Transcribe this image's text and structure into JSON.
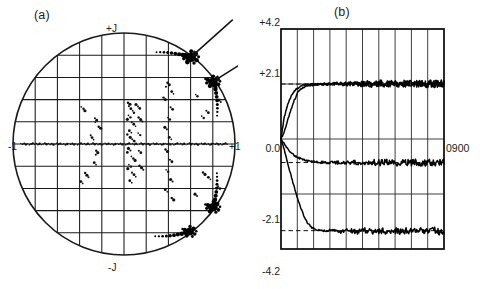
{
  "figure": {
    "background_color": "#ffffff",
    "ink_color": "#1a1a1a",
    "width": 491,
    "height": 289
  },
  "panel_a": {
    "caption": "(a)",
    "axis_labels": {
      "top": "+J",
      "bottom": "-J",
      "left": "-1",
      "right": "+1"
    },
    "annotations": [
      {
        "name": "arrow-upper-cluster",
        "label": ""
      },
      {
        "name": "arrow-right-cluster",
        "label": ""
      }
    ]
  },
  "panel_b": {
    "caption": "(b)",
    "tick_labels": {
      "top": "+4.2",
      "upper": "+2.1",
      "middle": "0.0",
      "lower": "-2.1",
      "bottom": "-4.2"
    },
    "trace_label": "0900"
  },
  "chart_data": [
    {
      "type": "scatter",
      "name": "panel-a-constellation",
      "title": "(a)",
      "xlabel": "",
      "ylabel": "",
      "xlim": [
        -1.0,
        1.0
      ],
      "ylim": [
        -1.0,
        1.0
      ],
      "grid": true,
      "grid_divisions": 10,
      "unit_circle": true,
      "axis_annotations": {
        "top": "+J",
        "bottom": "-J",
        "left": "-1",
        "right": "+1"
      },
      "arrows": [
        {
          "points_to_x": 0.6,
          "points_to_y": 0.78,
          "from_x": 0.98,
          "from_y": 1.12
        },
        {
          "points_to_x": 0.8,
          "points_to_y": 0.56,
          "from_x": 1.18,
          "from_y": 0.8
        }
      ],
      "clusters": [
        {
          "x": 0.6,
          "y": 0.78,
          "weight": 1.0,
          "label": "dense-cluster-upper-right"
        },
        {
          "x": 0.8,
          "y": 0.56,
          "weight": 0.9,
          "label": "dense-cluster-right-upper"
        },
        {
          "x": 0.8,
          "y": -0.57,
          "weight": 0.9,
          "label": "dense-cluster-right-lower"
        },
        {
          "x": 0.59,
          "y": -0.79,
          "weight": 0.85,
          "label": "dense-cluster-lower-right"
        }
      ],
      "points": [
        [
          -0.385,
          0.335
        ],
        [
          -0.365,
          0.318
        ],
        [
          -0.352,
          0.3
        ],
        [
          -0.262,
          0.232
        ],
        [
          -0.246,
          0.215
        ],
        [
          -0.258,
          0.196
        ],
        [
          -0.228,
          0.155
        ],
        [
          -0.21,
          0.142
        ],
        [
          -0.3,
          0.078
        ],
        [
          -0.288,
          0.058
        ],
        [
          -0.274,
          0.04
        ],
        [
          -0.25,
          -0.06
        ],
        [
          -0.236,
          -0.078
        ],
        [
          -0.254,
          -0.096
        ],
        [
          -0.268,
          -0.168
        ],
        [
          -0.252,
          -0.186
        ],
        [
          -0.35,
          -0.262
        ],
        [
          -0.334,
          -0.282
        ],
        [
          -0.32,
          -0.3
        ],
        [
          -0.388,
          -0.338
        ],
        [
          -0.372,
          -0.355
        ],
        [
          0.036,
          0.372
        ],
        [
          0.054,
          0.358
        ],
        [
          0.044,
          0.34
        ],
        [
          0.062,
          0.318
        ],
        [
          0.078,
          0.3
        ],
        [
          0.09,
          0.282
        ],
        [
          0.108,
          0.356
        ],
        [
          0.126,
          0.338
        ],
        [
          0.142,
          0.32
        ],
        [
          0.04,
          0.258
        ],
        [
          0.058,
          0.24
        ],
        [
          0.03,
          0.222
        ],
        [
          0.07,
          0.196
        ],
        [
          0.088,
          0.178
        ],
        [
          0.104,
          0.16
        ],
        [
          0.132,
          0.238
        ],
        [
          0.15,
          0.22
        ],
        [
          0.166,
          0.202
        ],
        [
          0.048,
          0.12
        ],
        [
          0.066,
          0.102
        ],
        [
          0.03,
          0.086
        ],
        [
          0.056,
          0.06
        ],
        [
          0.074,
          0.042
        ],
        [
          0.092,
          0.026
        ],
        [
          0.128,
          0.098
        ],
        [
          0.146,
          0.08
        ],
        [
          0.04,
          -0.04
        ],
        [
          0.058,
          -0.058
        ],
        [
          0.03,
          -0.076
        ],
        [
          0.066,
          -0.112
        ],
        [
          0.084,
          -0.13
        ],
        [
          0.1,
          -0.148
        ],
        [
          0.134,
          -0.06
        ],
        [
          0.152,
          -0.078
        ],
        [
          0.044,
          -0.186
        ],
        [
          0.062,
          -0.204
        ],
        [
          0.034,
          -0.222
        ],
        [
          0.072,
          -0.258
        ],
        [
          0.09,
          -0.276
        ],
        [
          0.106,
          -0.294
        ],
        [
          0.14,
          -0.196
        ],
        [
          0.158,
          -0.214
        ],
        [
          0.174,
          -0.232
        ],
        [
          0.052,
          -0.33
        ],
        [
          0.07,
          -0.348
        ],
        [
          0.392,
          0.552
        ],
        [
          0.408,
          0.534
        ],
        [
          0.378,
          0.516
        ],
        [
          0.43,
          0.472
        ],
        [
          0.446,
          0.452
        ],
        [
          0.356,
          0.418
        ],
        [
          0.372,
          0.4
        ],
        [
          0.42,
          0.33
        ],
        [
          0.438,
          0.312
        ],
        [
          0.396,
          0.238
        ],
        [
          0.414,
          0.22
        ],
        [
          0.368,
          0.15
        ],
        [
          0.386,
          0.132
        ],
        [
          0.408,
          0.06
        ],
        [
          0.426,
          0.042
        ],
        [
          0.374,
          -0.05
        ],
        [
          0.392,
          -0.068
        ],
        [
          0.414,
          -0.142
        ],
        [
          0.432,
          -0.16
        ],
        [
          0.38,
          -0.232
        ],
        [
          0.398,
          -0.25
        ],
        [
          0.42,
          -0.32
        ],
        [
          0.438,
          -0.338
        ],
        [
          0.372,
          -0.412
        ],
        [
          0.39,
          -0.43
        ],
        [
          0.43,
          -0.486
        ],
        [
          0.448,
          -0.504
        ],
        [
          0.742,
          0.3
        ],
        [
          0.76,
          0.282
        ],
        [
          0.7,
          0.252
        ],
        [
          0.718,
          0.234
        ],
        [
          0.856,
          0.396
        ],
        [
          0.872,
          0.378
        ],
        [
          0.76,
          -0.3
        ],
        [
          0.778,
          -0.318
        ],
        [
          0.712,
          -0.256
        ],
        [
          0.73,
          -0.274
        ],
        [
          0.848,
          -0.384
        ],
        [
          0.864,
          -0.402
        ],
        [
          0.646,
          0.446
        ],
        [
          0.662,
          0.43
        ],
        [
          0.64,
          -0.452
        ],
        [
          0.658,
          -0.468
        ]
      ]
    },
    {
      "type": "line",
      "name": "panel-b-convergence",
      "title": "(b)",
      "xlabel": "",
      "ylabel": "",
      "ylim": [
        -4.2,
        4.2
      ],
      "xlim": [
        0,
        10
      ],
      "grid": true,
      "grid_columns": 10,
      "grid_rows": 4,
      "ytick_values": [
        4.2,
        2.1,
        0.0,
        -2.1,
        -4.2
      ],
      "ytick_labels": [
        "+4.2",
        "+2.1",
        "0.0",
        "-2.1",
        "-4.2"
      ],
      "right_annotation": "0900",
      "right_annotation_value": 0.0,
      "reference_lines": [
        2.1,
        -0.9,
        -3.5
      ],
      "series": [
        {
          "name": "trace-1-upper-fast",
          "converges_to": 2.1,
          "values": [
            0.0,
            0.85,
            1.32,
            1.62,
            1.82,
            1.95,
            2.02,
            2.06,
            2.08,
            2.09,
            2.1,
            2.1,
            2.11,
            2.1,
            2.09,
            2.1,
            2.11,
            2.12,
            2.1,
            2.09,
            2.1,
            2.12,
            2.14,
            2.1,
            2.08,
            2.11,
            2.13,
            2.09,
            2.1,
            2.12,
            2.14,
            2.09,
            2.07,
            2.11,
            2.13,
            2.1,
            2.08,
            2.12,
            2.15,
            2.1,
            2.09,
            2.11,
            2.13,
            2.08,
            2.1,
            2.12,
            2.09,
            2.11,
            2.13,
            2.1
          ]
        },
        {
          "name": "trace-2-upper-slow",
          "converges_to": 2.1,
          "values": [
            0.0,
            0.3,
            0.72,
            1.12,
            1.48,
            1.76,
            1.92,
            2.0,
            2.04,
            2.06,
            2.07,
            2.08,
            2.09,
            2.09,
            2.1,
            2.1,
            2.11,
            2.1,
            2.09,
            2.1,
            2.11,
            2.12,
            2.1,
            2.09,
            2.11,
            2.12,
            2.1,
            2.08,
            2.1,
            2.12,
            2.11,
            2.09,
            2.1,
            2.12,
            2.13,
            2.1,
            2.08,
            2.11,
            2.12,
            2.1,
            2.09,
            2.11,
            2.12,
            2.1,
            2.09,
            2.11,
            2.1,
            2.12,
            2.11,
            2.1
          ]
        },
        {
          "name": "trace-3-lower-shallow",
          "converges_to": -0.9,
          "values": [
            0.0,
            -0.2,
            -0.38,
            -0.52,
            -0.62,
            -0.7,
            -0.76,
            -0.8,
            -0.83,
            -0.85,
            -0.87,
            -0.88,
            -0.89,
            -0.89,
            -0.9,
            -0.9,
            -0.9,
            -0.9,
            -0.9,
            -0.91,
            -0.9,
            -0.9,
            -0.89,
            -0.9,
            -0.91,
            -0.9,
            -0.9,
            -0.89,
            -0.9,
            -0.91,
            -0.9,
            -0.9,
            -0.89,
            -0.9,
            -0.91,
            -0.9,
            -0.89,
            -0.9,
            -0.91,
            -0.9,
            -0.9,
            -0.89,
            -0.9,
            -0.91,
            -0.9,
            -0.9,
            -0.9,
            -0.89,
            -0.9,
            -0.9
          ]
        },
        {
          "name": "trace-4-lower-deep",
          "converges_to": -3.5,
          "values": [
            0.0,
            -0.42,
            -0.92,
            -1.4,
            -1.85,
            -2.28,
            -2.66,
            -2.98,
            -3.2,
            -3.35,
            -3.44,
            -3.48,
            -3.5,
            -3.51,
            -3.5,
            -3.49,
            -3.5,
            -3.52,
            -3.54,
            -3.51,
            -3.48,
            -3.5,
            -3.53,
            -3.55,
            -3.51,
            -3.48,
            -3.5,
            -3.54,
            -3.52,
            -3.49,
            -3.5,
            -3.53,
            -3.55,
            -3.51,
            -3.48,
            -3.51,
            -3.54,
            -3.52,
            -3.49,
            -3.51,
            -3.53,
            -3.5,
            -3.48,
            -3.52,
            -3.54,
            -3.51,
            -3.49,
            -3.52,
            -3.53,
            -3.5
          ]
        }
      ]
    }
  ]
}
